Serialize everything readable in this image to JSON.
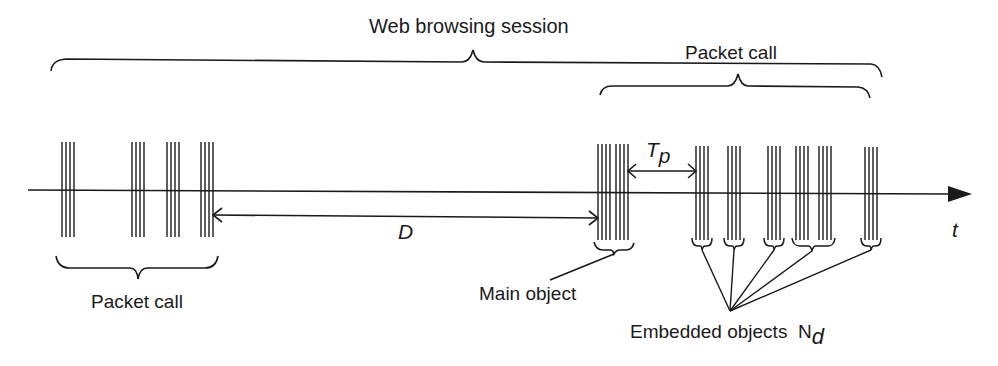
{
  "diagram": {
    "title": "Web browsing session",
    "labels": {
      "session": "Web browsing session",
      "packet_call_top": "Packet call",
      "packet_call_bottom": "Packet call",
      "reading_time": "D",
      "parsing_time_T": "T",
      "parsing_time_sub": "p",
      "time_axis": "t",
      "main_object": "Main object",
      "embedded_objects": "Embedded objects",
      "embedded_symbol": "N",
      "embedded_sub": "d"
    },
    "colors": {
      "line": "#1a1a1a",
      "background": "#ffffff"
    },
    "first_packet_call": {
      "groups": [
        {
          "x": 62,
          "lines": 4
        },
        {
          "x": 133,
          "lines": 4
        },
        {
          "x": 168,
          "lines": 4
        },
        {
          "x": 202,
          "lines": 4
        }
      ]
    },
    "second_packet_call": {
      "main_object": {
        "x": 598,
        "lines": 8
      },
      "embedded_objects": [
        {
          "x": 695,
          "lines": 4
        },
        {
          "x": 728,
          "lines": 4
        },
        {
          "x": 768,
          "lines": 4
        },
        {
          "x": 797,
          "lines": 4
        },
        {
          "x": 820,
          "lines": 4
        },
        {
          "x": 866,
          "lines": 4
        }
      ]
    }
  }
}
